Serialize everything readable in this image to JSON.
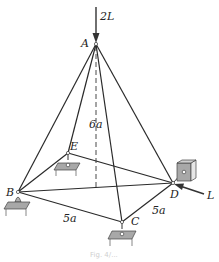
{
  "diagram": {
    "type": "space truss (pyramid)",
    "nodes": {
      "A": {
        "label": "A",
        "x": 96,
        "y": 44
      },
      "B": {
        "label": "B",
        "x": 18,
        "y": 192
      },
      "C": {
        "label": "C",
        "x": 122,
        "y": 222
      },
      "D": {
        "label": "D",
        "x": 173,
        "y": 183
      },
      "E": {
        "label": "E",
        "x": 68,
        "y": 153
      }
    },
    "members": [
      "AB",
      "AC",
      "AD",
      "AE",
      "BC",
      "CD",
      "BD",
      "BE",
      "ED"
    ],
    "dimensions": {
      "height": "6a",
      "BC": "5a",
      "CD": "5a"
    },
    "loads": {
      "vertical": "2L",
      "horizontal": "L"
    },
    "colors": {
      "line": "#2a2a2a",
      "support_fill": "#a8a8a8",
      "support_dark": "#7a7a7a"
    },
    "caption": "Fig. 4/..."
  }
}
